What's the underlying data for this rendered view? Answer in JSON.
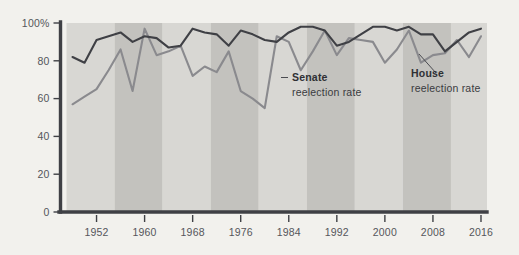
{
  "chart_data": {
    "type": "line",
    "title": "",
    "subtitle": "",
    "xlabel": "",
    "ylabel": "",
    "xlim": [
      1946,
      2017
    ],
    "ylim": [
      0,
      100
    ],
    "grid": false,
    "legend_position": "inline-annotations",
    "y_ticks": [
      "0",
      "20",
      "40",
      "60",
      "80",
      "100%"
    ],
    "y_tick_values": [
      0,
      20,
      40,
      60,
      80,
      100
    ],
    "x_ticks": [
      "1952",
      "1960",
      "1968",
      "1976",
      "1984",
      "1992",
      "2000",
      "2008",
      "2016"
    ],
    "x_tick_values": [
      1952,
      1960,
      1968,
      1976,
      1984,
      1992,
      2000,
      2008,
      2016
    ],
    "x": [
      1948,
      1950,
      1952,
      1954,
      1956,
      1958,
      1960,
      1962,
      1964,
      1966,
      1968,
      1970,
      1972,
      1974,
      1976,
      1978,
      1980,
      1982,
      1984,
      1986,
      1988,
      1990,
      1992,
      1994,
      1996,
      1998,
      2000,
      2002,
      2004,
      2006,
      2008,
      2010,
      2012,
      2014,
      2016
    ],
    "series": [
      {
        "name": "House reelection rate",
        "color": "#3f4045",
        "label_bold": "House",
        "label_rest": "reelection rate",
        "values": [
          82,
          79,
          91,
          93,
          95,
          90,
          93,
          92,
          87,
          88,
          97,
          95,
          94,
          88,
          96,
          94,
          91,
          90,
          95,
          98,
          98,
          96,
          88,
          90,
          94,
          98,
          98,
          96,
          98,
          94,
          94,
          85,
          90,
          95,
          97
        ]
      },
      {
        "name": "Senate reelection rate",
        "color": "#8a8a8e",
        "label_bold": "Senate",
        "label_rest": "reelection rate",
        "values": [
          57,
          61,
          65,
          75,
          86,
          64,
          97,
          83,
          85,
          88,
          72,
          77,
          74,
          85,
          64,
          60,
          55,
          93,
          90,
          75,
          85,
          96,
          83,
          92,
          91,
          90,
          79,
          86,
          96,
          79,
          83,
          84,
          91,
          82,
          93
        ]
      }
    ],
    "bands": {
      "note": "alternating 8-year vertical shading blocks",
      "light": "#d8d7d3",
      "dark": "#c3c2be",
      "boundaries": [
        1947,
        1955,
        1963,
        1971,
        1979,
        1987,
        1995,
        2003,
        2011,
        2018
      ]
    },
    "annotations": [
      {
        "id": "senate-annotation",
        "bold": "Senate",
        "rest": "reelection rate"
      },
      {
        "id": "house-annotation",
        "bold": "House",
        "rest": "reelection rate"
      }
    ],
    "colors": {
      "background": "#f2f1ed",
      "axis": "#3f4045",
      "house_line": "#3f4045",
      "senate_line": "#8a8a8e",
      "tick_text": "#55565b"
    }
  }
}
